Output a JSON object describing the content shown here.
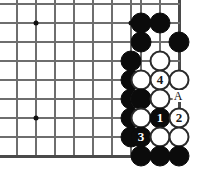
{
  "diagram": {
    "kind": "go-board-problem",
    "geometry": {
      "width": 201,
      "height": 174,
      "cell": 19,
      "cols_x": [
        17,
        36,
        55,
        74,
        93,
        112,
        131,
        141,
        160,
        179
      ],
      "rows_y": [
        4,
        23,
        42,
        61,
        80,
        99,
        118,
        137,
        156
      ],
      "stone_diameter": 21
    },
    "grid": {
      "vertical_lines_x": [
        17,
        36,
        55,
        74,
        93,
        112,
        131,
        141,
        160,
        179
      ],
      "horizontal_lines_y": [
        4,
        23,
        42,
        61,
        80,
        99,
        118,
        137,
        156
      ],
      "grid_color": "#6e6e6e",
      "edge_color": "#4a4a4a",
      "right_edge_x": 179,
      "bottom_edge_y": 156,
      "show_grid": true
    },
    "star_points": [
      {
        "x": 36,
        "y": 23
      },
      {
        "x": 131,
        "y": 23
      },
      {
        "x": 36,
        "y": 118
      }
    ],
    "stones": [
      {
        "color": "black",
        "x": 141,
        "y": 23,
        "label": ""
      },
      {
        "color": "black",
        "x": 160,
        "y": 23,
        "label": ""
      },
      {
        "color": "black",
        "x": 141,
        "y": 42,
        "label": ""
      },
      {
        "color": "black",
        "x": 179,
        "y": 42,
        "label": ""
      },
      {
        "color": "black",
        "x": 131,
        "y": 61,
        "label": ""
      },
      {
        "color": "white",
        "x": 160,
        "y": 61,
        "label": ""
      },
      {
        "color": "black",
        "x": 131,
        "y": 80,
        "label": ""
      },
      {
        "color": "white",
        "x": 141,
        "y": 80,
        "label": ""
      },
      {
        "color": "white",
        "x": 179,
        "y": 80,
        "label": ""
      },
      {
        "color": "black",
        "x": 131,
        "y": 99,
        "label": ""
      },
      {
        "color": "white",
        "x": 141,
        "y": 99,
        "label": ""
      },
      {
        "color": "white",
        "x": 160,
        "y": 80,
        "label": "4"
      },
      {
        "color": "black",
        "x": 131,
        "y": 118,
        "label": ""
      },
      {
        "color": "black",
        "x": 141,
        "y": 99,
        "label": ""
      },
      {
        "color": "white",
        "x": 160,
        "y": 99,
        "label": ""
      },
      {
        "color": "white",
        "x": 141,
        "y": 118,
        "label": ""
      },
      {
        "color": "black",
        "x": 160,
        "y": 118,
        "label": "1"
      },
      {
        "color": "white",
        "x": 179,
        "y": 118,
        "label": "2"
      },
      {
        "color": "black",
        "x": 131,
        "y": 137,
        "label": ""
      },
      {
        "color": "black",
        "x": 141,
        "y": 137,
        "label": "3"
      },
      {
        "color": "white",
        "x": 160,
        "y": 137,
        "label": ""
      },
      {
        "color": "white",
        "x": 179,
        "y": 137,
        "label": ""
      },
      {
        "color": "black",
        "x": 141,
        "y": 156,
        "label": ""
      },
      {
        "color": "black",
        "x": 160,
        "y": 156,
        "label": ""
      },
      {
        "color": "black",
        "x": 179,
        "y": 156,
        "label": ""
      }
    ],
    "labels": [
      {
        "text": "A",
        "x": 178,
        "y": 96
      }
    ]
  }
}
